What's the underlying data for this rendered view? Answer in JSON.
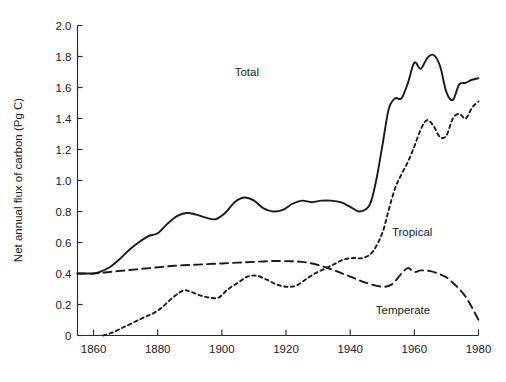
{
  "chart_data": {
    "type": "line",
    "title": "",
    "xlabel": "",
    "ylabel": "Net annual flux of carbon (Pg C)",
    "xlim": [
      1855,
      1980
    ],
    "ylim": [
      0,
      2.0
    ],
    "grid": false,
    "legend": "inline-labels",
    "xticks": [
      1860,
      1880,
      1900,
      1920,
      1940,
      1960,
      1980
    ],
    "xticklabels": [
      "1860",
      "1880",
      "1900",
      "1920",
      "1940",
      "1960",
      "1980"
    ],
    "yticks": [
      0,
      0.2,
      0.4,
      0.6,
      0.8,
      1.0,
      1.2,
      1.4,
      1.6,
      1.8,
      2.0
    ],
    "yticklabels": [
      "0",
      "0.2",
      "0.4",
      "0.6",
      "0.8",
      "1.0",
      "1.2",
      "1.4",
      "1.6",
      "1.8",
      "2.0"
    ],
    "series": [
      {
        "name": "Total",
        "style": "solid",
        "label_position": {
          "x": 1904,
          "y": 1.7
        },
        "x": [
          1855,
          1858,
          1860,
          1862,
          1865,
          1868,
          1871,
          1874,
          1877,
          1880,
          1883,
          1886,
          1889,
          1892,
          1895,
          1898,
          1901,
          1904,
          1907,
          1910,
          1913,
          1916,
          1919,
          1922,
          1925,
          1928,
          1931,
          1934,
          1937,
          1940,
          1943,
          1946,
          1948,
          1950,
          1952,
          1954,
          1956,
          1958,
          1960,
          1962,
          1964,
          1966,
          1968,
          1970,
          1972,
          1974,
          1976,
          1978,
          1980
        ],
        "y": [
          0.4,
          0.4,
          0.4,
          0.41,
          0.44,
          0.49,
          0.55,
          0.6,
          0.64,
          0.66,
          0.72,
          0.77,
          0.79,
          0.78,
          0.76,
          0.75,
          0.79,
          0.86,
          0.89,
          0.87,
          0.82,
          0.8,
          0.81,
          0.85,
          0.87,
          0.86,
          0.87,
          0.87,
          0.86,
          0.83,
          0.8,
          0.84,
          0.99,
          1.22,
          1.46,
          1.53,
          1.53,
          1.63,
          1.76,
          1.72,
          1.79,
          1.81,
          1.74,
          1.57,
          1.52,
          1.62,
          1.63,
          1.65,
          1.66
        ]
      },
      {
        "name": "Temperate",
        "style": "long-dash",
        "label_position": {
          "x": 1948,
          "y": 0.165
        },
        "x": [
          1855,
          1860,
          1865,
          1870,
          1875,
          1880,
          1885,
          1890,
          1895,
          1900,
          1905,
          1910,
          1915,
          1920,
          1925,
          1930,
          1935,
          1940,
          1945,
          1950,
          1953,
          1956,
          1958,
          1960,
          1962,
          1965,
          1968,
          1970,
          1972,
          1974,
          1976,
          1978,
          1980
        ],
        "y": [
          0.4,
          0.4,
          0.41,
          0.42,
          0.43,
          0.44,
          0.45,
          0.455,
          0.46,
          0.465,
          0.47,
          0.475,
          0.48,
          0.48,
          0.475,
          0.455,
          0.42,
          0.38,
          0.34,
          0.315,
          0.33,
          0.4,
          0.435,
          0.41,
          0.42,
          0.415,
          0.395,
          0.375,
          0.34,
          0.3,
          0.25,
          0.18,
          0.1
        ]
      },
      {
        "name": "Tropical",
        "style": "short-dash",
        "label_position": {
          "x": 1953,
          "y": 0.665
        },
        "x": [
          1863,
          1866,
          1870,
          1875,
          1880,
          1885,
          1888,
          1890,
          1893,
          1896,
          1899,
          1902,
          1905,
          1908,
          1911,
          1914,
          1917,
          1920,
          1923,
          1926,
          1929,
          1932,
          1935,
          1938,
          1941,
          1944,
          1947,
          1950,
          1952,
          1954,
          1956,
          1958,
          1960,
          1962,
          1964,
          1966,
          1968,
          1970,
          1972,
          1974,
          1976,
          1978,
          1980
        ],
        "y": [
          0.0,
          0.02,
          0.06,
          0.11,
          0.16,
          0.25,
          0.29,
          0.285,
          0.26,
          0.245,
          0.245,
          0.3,
          0.34,
          0.38,
          0.385,
          0.36,
          0.33,
          0.315,
          0.32,
          0.36,
          0.4,
          0.43,
          0.46,
          0.49,
          0.5,
          0.5,
          0.54,
          0.66,
          0.81,
          0.95,
          1.04,
          1.12,
          1.22,
          1.33,
          1.39,
          1.35,
          1.28,
          1.29,
          1.4,
          1.43,
          1.4,
          1.47,
          1.51
        ]
      }
    ]
  },
  "axes": {
    "y_title": "Net annual flux of carbon (Pg C)"
  },
  "labels": {
    "total": "Total",
    "tropical": "Tropical",
    "temperate": "Temperate"
  }
}
